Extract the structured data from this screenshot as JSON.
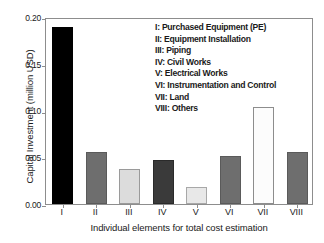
{
  "chart_data": {
    "type": "bar",
    "title": "",
    "subtitle": "",
    "xlabel": "Individual elements for total cost estimation",
    "ylabel": "Capital Investment (million USD)",
    "categories": [
      "I",
      "II",
      "III",
      "IV",
      "V",
      "VI",
      "VII",
      "VIII"
    ],
    "values": [
      0.189,
      0.0555,
      0.037,
      0.047,
      0.018,
      0.0515,
      0.1035,
      0.0555
    ],
    "bar_colors": [
      "#000000",
      "#6e6e6e",
      "#dcdcdc",
      "#3a3a3a",
      "#e8e8e8",
      "#6e6e6e",
      "#fcfcfc",
      "#6e6e6e"
    ],
    "bar_edge_colors": [
      "#000000",
      "#5a5a5a",
      "#9a9a9a",
      "#2a2a2a",
      "#a8a8a8",
      "#5a5a5a",
      "#8d8d8d",
      "#5a5a5a"
    ],
    "ylim": [
      0.0,
      0.2
    ],
    "yticks": [
      0.0,
      0.05,
      0.1,
      0.15,
      0.2
    ],
    "ytick_labels": [
      "0.00",
      "0.05",
      "0.10",
      "0.15",
      "0.20"
    ],
    "grid": false,
    "legend_position": "upper-right-inside",
    "legend": [
      "I: Purchased Equipment (PE)",
      "II: Equipment Installation",
      "III: Piping",
      "IV: Civil Works",
      "V: Electrical Works",
      "VI: Instrumentation and Control",
      "VII: Land",
      "VIII: Others"
    ]
  }
}
